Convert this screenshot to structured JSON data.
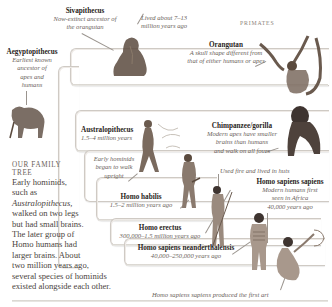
{
  "labels": {
    "sivapithecus": {
      "name": "Sivapithecus",
      "desc": [
        "Now-extinct ancestor of",
        "the orangutan"
      ]
    },
    "lived_note": [
      "Lived about 7–13",
      "million years ago"
    ],
    "primates": "PRIMATES",
    "orangutan": {
      "name": "Orangutan",
      "desc": [
        "A skull shape different from",
        "that of either humans or apes"
      ]
    },
    "aegyptopithecus": {
      "name": "Aegyptopithecus",
      "desc": [
        "Earliest known",
        "ancestor of",
        "apes and",
        "humans"
      ]
    },
    "chimpanzee": {
      "name": "Chimpanzee/gorilla",
      "desc": [
        "Modern apes have smaller",
        "brains than humans",
        "and walk on all fours"
      ]
    },
    "australopithecus": {
      "name": "Australopithecus",
      "date": "1.5–4 million years"
    },
    "early_hominids": [
      "Early hominids",
      "began to walk",
      "upright"
    ],
    "fire_note": "Used fire and lived in huts",
    "homo_sapiens_sapiens": {
      "name": "Homo sapiens sapiens",
      "desc": [
        "Modern humans first",
        "seen in Africa"
      ],
      "date": "40,000 years ago"
    },
    "homo_habilis": {
      "name": "Homo habilis",
      "date": "1.5–2 million years ago"
    },
    "homo_erectus": {
      "name": "Homo erectus",
      "date": "300,000–1.5 million years ago"
    },
    "neanderthalensis": {
      "name": "Homo sapiens neanderthalensis",
      "date": "40,000–250,000 years ago"
    },
    "first_art": "Homo sapiens sapiens produced the first art"
  },
  "intro": {
    "heading": [
      "OUR FAMILY",
      "TREE"
    ],
    "body": [
      "Early hominids,",
      "such as",
      "Australopithecus,",
      "walked on two legs",
      "but had small brains.",
      "The later group of",
      "Homo humans had",
      "larger brains. About",
      "two million years ago,",
      "several species of hominids",
      "existed alongside each other."
    ]
  },
  "colors": {
    "frame": "#cfcac4",
    "text_title": "#2a2522",
    "text_italic": "#6a625a",
    "figure": "#5a4a3e"
  }
}
